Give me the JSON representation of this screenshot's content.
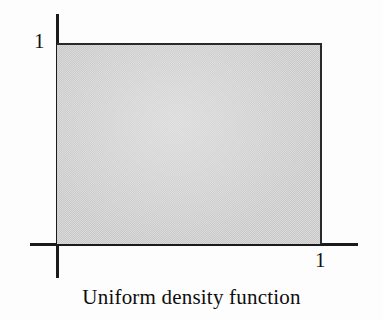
{
  "figure": {
    "caption": "Uniform density function",
    "background_color": "#fdfdfd",
    "axis_color": "#1b1b1b",
    "fill_color": "#d9d9d9",
    "outline_color": "#2a2a2a",
    "y_axis_label": "1",
    "x_axis_label": "1"
  },
  "chart_data": {
    "type": "area",
    "title": "Uniform density function",
    "xlabel": "",
    "ylabel": "",
    "x": [
      0,
      1
    ],
    "values": [
      1,
      1
    ],
    "series": [
      {
        "name": "Uniform density f(x)",
        "values": [
          1,
          1
        ]
      }
    ],
    "xlim": [
      0,
      1
    ],
    "ylim": [
      0,
      1
    ],
    "xticks": [
      1
    ],
    "xticklabels": [
      "1"
    ],
    "yticks": [
      1
    ],
    "yticklabels": [
      "1"
    ],
    "grid": false,
    "legend": "none",
    "annotations": [
      {
        "text": "1",
        "axis": "y",
        "value": 1
      },
      {
        "text": "1",
        "axis": "x",
        "value": 1
      }
    ]
  }
}
